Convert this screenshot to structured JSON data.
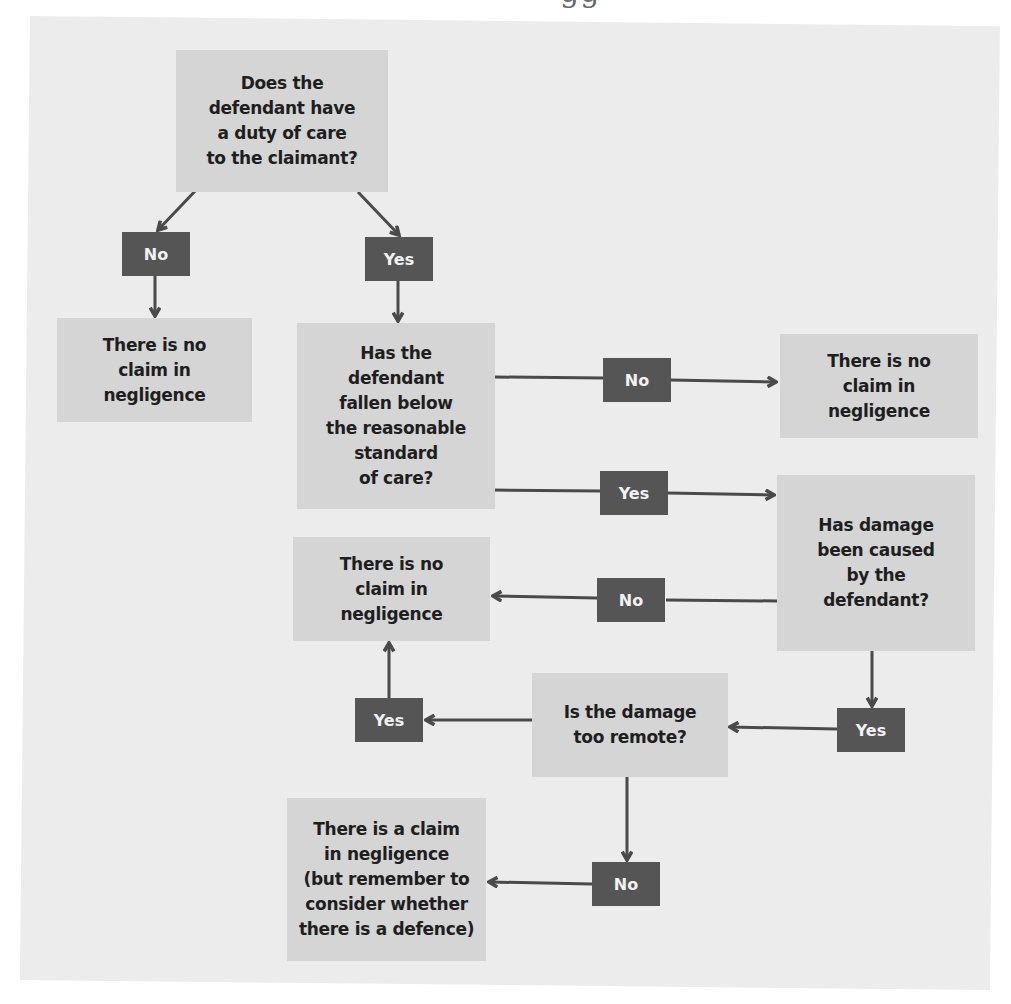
{
  "page": {
    "heading_fragment": "gg"
  },
  "flowchart": {
    "nodes": {
      "q_duty": "Does the\ndefendant have\na duty of care\nto the claimant?",
      "no_claim_1": "There is no\nclaim in\nnegligence",
      "q_standard": "Has the\ndefendant\nfallen below\nthe reasonable\nstandard\nof care?",
      "no_claim_2": "There is no\nclaim in\nnegligence",
      "q_causation": "Has damage\nbeen caused\nby the\ndefendant?",
      "no_claim_3": "There is no\nclaim in\nnegligence",
      "q_remote": "Is the damage\ntoo remote?",
      "claim_exists": "There is a claim\nin negligence\n(but remember to\nconsider whether\nthere is a defence)"
    },
    "labels": {
      "duty_no": "No",
      "duty_yes": "Yes",
      "standard_no": "No",
      "standard_yes": "Yes",
      "causation_no": "No",
      "causation_yes": "Yes",
      "remote_yes": "Yes",
      "remote_no": "No"
    },
    "edges": [
      {
        "from": "q_duty",
        "label": "No",
        "to": "no_claim_1"
      },
      {
        "from": "q_duty",
        "label": "Yes",
        "to": "q_standard"
      },
      {
        "from": "q_standard",
        "label": "No",
        "to": "no_claim_2"
      },
      {
        "from": "q_standard",
        "label": "Yes",
        "to": "q_causation"
      },
      {
        "from": "q_causation",
        "label": "No",
        "to": "no_claim_3"
      },
      {
        "from": "q_causation",
        "label": "Yes",
        "to": "q_remote"
      },
      {
        "from": "q_remote",
        "label": "Yes",
        "to": "no_claim_3"
      },
      {
        "from": "q_remote",
        "label": "No",
        "to": "claim_exists"
      }
    ],
    "colors": {
      "panel": "#ececec",
      "box_fill": "#d5d5d5",
      "label_fill": "#555555",
      "connector": "#4a4a4a"
    }
  }
}
